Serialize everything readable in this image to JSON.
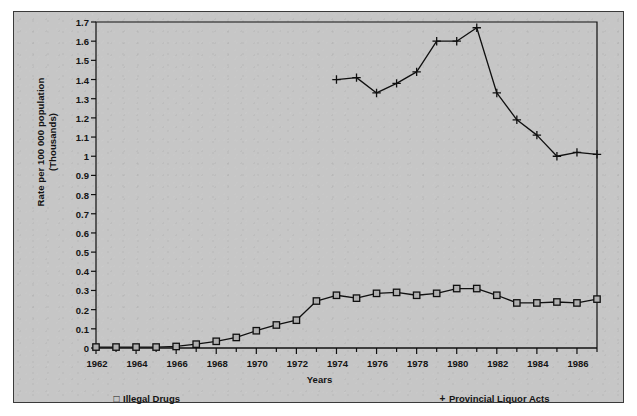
{
  "chart_data": {
    "type": "line",
    "title": "",
    "xlabel": "Years",
    "ylabel": "Rate per 100 000 population (Thousands)",
    "ylabel_line1": "Rate per 100 000 population",
    "ylabel_line2": "(Thousands)",
    "xlim": [
      1962,
      1987
    ],
    "ylim": [
      0,
      1.7
    ],
    "ytick_step": 0.1,
    "xtick_step": 1,
    "xtick_label_step": 2,
    "grid": false,
    "legend_position": "bottom",
    "yticks": [
      "0",
      "0.1",
      "0.2",
      "0.3",
      "0.4",
      "0.5",
      "0.6",
      "0.7",
      "0.8",
      "0.9",
      "1",
      "1.1",
      "1.2",
      "1.3",
      "1.4",
      "1.5",
      "1.6",
      "1.7"
    ],
    "xticks_all": [
      1962,
      1963,
      1964,
      1965,
      1966,
      1967,
      1968,
      1969,
      1970,
      1971,
      1972,
      1973,
      1974,
      1975,
      1976,
      1977,
      1978,
      1979,
      1980,
      1981,
      1982,
      1983,
      1984,
      1985,
      1986,
      1987
    ],
    "xtick_labels": [
      "1962",
      "1964",
      "1966",
      "1968",
      "1970",
      "1972",
      "1974",
      "1976",
      "1978",
      "1980",
      "1982",
      "1984",
      "1986"
    ],
    "series": [
      {
        "name": "Illegal Drugs",
        "marker": "square",
        "marker_glyph": "□",
        "color": "#101010",
        "x": [
          1962,
          1963,
          1964,
          1965,
          1966,
          1967,
          1968,
          1969,
          1970,
          1971,
          1972,
          1973,
          1974,
          1975,
          1976,
          1977,
          1978,
          1979,
          1980,
          1981,
          1982,
          1983,
          1984,
          1985,
          1986,
          1987
        ],
        "values": [
          0.005,
          0.005,
          0.005,
          0.005,
          0.008,
          0.02,
          0.035,
          0.055,
          0.09,
          0.12,
          0.145,
          0.245,
          0.275,
          0.26,
          0.285,
          0.29,
          0.275,
          0.285,
          0.31,
          0.31,
          0.275,
          0.235,
          0.235,
          0.24,
          0.235,
          0.255
        ]
      },
      {
        "name": "Provincial Liquor Acts",
        "marker": "plus",
        "marker_glyph": "+",
        "color": "#101010",
        "x": [
          1974,
          1975,
          1976,
          1977,
          1978,
          1979,
          1980,
          1981,
          1982,
          1983,
          1984,
          1985,
          1986,
          1987
        ],
        "values": [
          1.4,
          1.41,
          1.33,
          1.38,
          1.44,
          1.6,
          1.6,
          1.67,
          1.33,
          1.19,
          1.11,
          1.0,
          1.02,
          1.01
        ]
      }
    ]
  },
  "legend": {
    "drugs": {
      "marker": "□",
      "label": "Illegal Drugs"
    },
    "liquor": {
      "marker": "+",
      "label": "Provincial Liquor Acts"
    }
  },
  "colors": {
    "background": "#c6c6c6",
    "frame": "#3a3a3a",
    "axis": "#101010",
    "text": "#141414"
  }
}
